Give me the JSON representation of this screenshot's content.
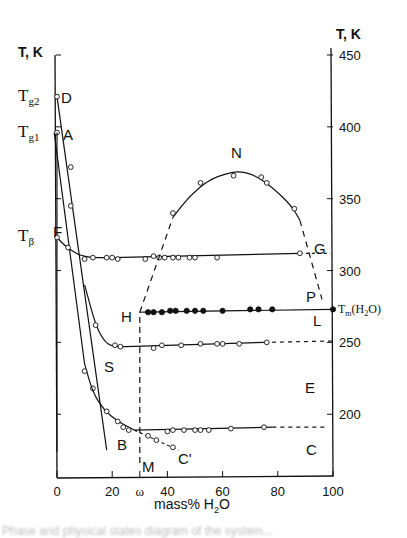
{
  "chart_data": {
    "type": "line",
    "title": "",
    "xlabel": "mass% H2O",
    "ylabel_left": "T, K",
    "ylabel_right": "T, K",
    "xlim": [
      0,
      100
    ],
    "ylim": [
      165,
      455
    ],
    "grid": false,
    "x_ticks": [
      "0",
      "20",
      "ω",
      "40",
      "60",
      "80",
      "100"
    ],
    "x_tick_values": [
      0,
      20,
      30,
      40,
      60,
      80,
      100
    ],
    "y_ticks_right": [
      "450",
      "400",
      "350",
      "300",
      "250",
      "200"
    ],
    "y_labels_left": [
      "Tg2",
      "Tg1",
      "Tβ"
    ],
    "special_labels": {
      "Tm": "Tm(H2O)"
    },
    "point_labels": [
      "D",
      "A",
      "F",
      "N",
      "G",
      "P",
      "H",
      "L",
      "S",
      "E",
      "B",
      "C'",
      "M",
      "C"
    ],
    "series": [
      {
        "name": "D curve (Tg2)",
        "style": "solid-open-circles",
        "x": [
          0,
          2,
          4,
          6,
          8,
          10,
          12,
          14,
          16,
          18
        ],
        "y": [
          421,
          398,
          378,
          358,
          338,
          318,
          298,
          278,
          260,
          245
        ]
      },
      {
        "name": "A-B curve (Tg1)",
        "style": "solid-open-circles",
        "x": [
          0,
          2,
          5,
          9,
          12,
          15,
          20,
          25,
          28
        ],
        "y": [
          396,
          366,
          335,
          295,
          262,
          230,
          205,
          193,
          189
        ]
      },
      {
        "name": "F-G line (Tβ)",
        "style": "solid-open-circles",
        "x": [
          0,
          4,
          10,
          15,
          20,
          30,
          40,
          50,
          60,
          80,
          100
        ],
        "y": [
          323,
          315,
          309,
          309,
          309,
          309,
          309,
          309,
          310,
          311,
          312
        ]
      },
      {
        "name": "S-E line",
        "style": "solid-open-circles then dashed",
        "x": [
          18,
          20,
          25,
          30,
          40,
          50,
          60,
          75,
          90
        ],
        "y": [
          247,
          247,
          247,
          247,
          248,
          248,
          249,
          250,
          250
        ]
      },
      {
        "name": "H-L line (Tm)",
        "style": "solid-filled-circles",
        "x": [
          30,
          35,
          40,
          50,
          60,
          70,
          80,
          100
        ],
        "y": [
          271,
          271,
          272,
          272,
          272,
          273,
          273,
          273
        ]
      },
      {
        "name": "B-C line",
        "style": "solid-open-circles then dashed",
        "x": [
          28,
          40,
          50,
          60,
          75,
          90
        ],
        "y": [
          189,
          189,
          189,
          190,
          190,
          190
        ]
      },
      {
        "name": "B-C' branch",
        "style": "dashed-open-circles",
        "x": [
          28,
          33,
          37,
          42
        ],
        "y": [
          189,
          184,
          180,
          175
        ]
      },
      {
        "name": "H-N-P curve",
        "style": "dashed then solid-open-circles",
        "x": [
          30,
          40,
          45,
          55,
          65,
          75,
          80,
          85,
          95
        ],
        "y": [
          271,
          322,
          346,
          362,
          369,
          362,
          355,
          343,
          278
        ]
      },
      {
        "name": "M vertical (ω)",
        "style": "dashed",
        "x": [
          30,
          30
        ],
        "y": [
          165,
          271
        ]
      }
    ]
  },
  "axes": {
    "left_title": "T, K",
    "right_title": "T, K",
    "x_title_main": "mass% H",
    "x_title_sub": "2",
    "x_title_end": "O",
    "tm_main": "T",
    "tm_sub": "m",
    "tm_rest": "(H",
    "tm_sub2": "2",
    "tm_end": "O)"
  },
  "left_labels": {
    "tg2_main": "T",
    "tg2_sub": "g2",
    "tg1_main": "T",
    "tg1_sub": "g1",
    "tb_main": "T",
    "tb_sub": "β"
  },
  "caption": "Phase and physical states diagram of the system..."
}
